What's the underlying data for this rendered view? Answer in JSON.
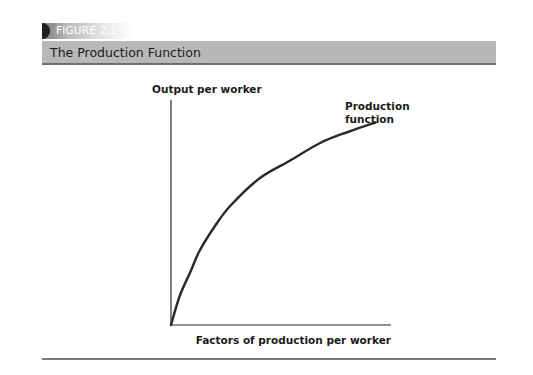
{
  "figure": {
    "number_label": "FIGURE 2.1",
    "title": "The Production Function"
  },
  "chart_data": {
    "type": "line",
    "title": "The Production Function",
    "xlabel": "Factors of production per worker",
    "ylabel": "Output per worker",
    "series": [
      {
        "name": "Production function",
        "label_lines": [
          "Production",
          "function"
        ],
        "x": [
          0,
          0.04,
          0.09,
          0.13,
          0.2,
          0.27,
          0.4,
          0.54,
          0.68,
          0.81,
          0.93
        ],
        "y": [
          0,
          0.13,
          0.24,
          0.33,
          0.44,
          0.53,
          0.65,
          0.73,
          0.81,
          0.86,
          0.9
        ]
      }
    ],
    "xlim": [
      0,
      1
    ],
    "ylim": [
      0,
      1
    ],
    "ticks": "none",
    "grid": false,
    "legend": "inline label near curve end",
    "colors": {
      "curve": "#2a2a2a",
      "axes": "#2a2a2a"
    }
  }
}
